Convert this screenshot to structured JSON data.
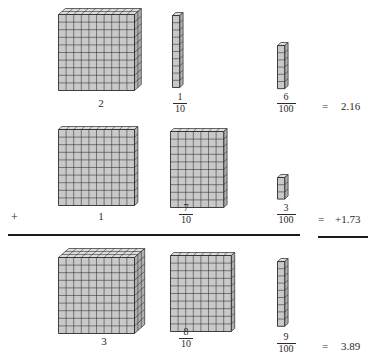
{
  "figure": {
    "operation": "addition",
    "colors": {
      "cube_face": "#c9c9c9",
      "cube_top": "#dcdcdc",
      "cube_side": "#b0b0b0",
      "stroke": "#2b2b2b",
      "text": "#2a2a2a",
      "rule": "#1a1a1a",
      "background": "#ffffff"
    }
  },
  "rows": [
    {
      "id": "addend-1",
      "operator": "",
      "equals_sign": "=",
      "result": "2.16",
      "terms": [
        {
          "place": "ones",
          "label_type": "whole",
          "whole": "2",
          "numerator": "",
          "denominator": "",
          "block": {
            "kind": "flat-stack",
            "cols": 10,
            "rows": 10,
            "depth": 2,
            "count": 200,
            "value": 2
          }
        },
        {
          "place": "tenths",
          "label_type": "fraction",
          "whole": "",
          "numerator": "1",
          "denominator": "10",
          "block": {
            "kind": "rod",
            "cols": 1,
            "rows": 10,
            "depth": 1,
            "count": 10,
            "value": 0.1
          }
        },
        {
          "place": "hundredths",
          "label_type": "fraction",
          "whole": "",
          "numerator": "6",
          "denominator": "100",
          "block": {
            "kind": "unit-stack",
            "cols": 1,
            "rows": 6,
            "depth": 1,
            "count": 6,
            "value": 0.06
          }
        }
      ]
    },
    {
      "id": "addend-2",
      "operator": "+",
      "equals_sign": "=",
      "result": "+1.73",
      "terms": [
        {
          "place": "ones",
          "label_type": "whole",
          "whole": "1",
          "numerator": "",
          "denominator": "",
          "block": {
            "kind": "flat-stack",
            "cols": 10,
            "rows": 10,
            "depth": 1,
            "count": 100,
            "value": 1
          }
        },
        {
          "place": "tenths",
          "label_type": "fraction",
          "whole": "",
          "numerator": "7",
          "denominator": "10",
          "block": {
            "kind": "rod-group",
            "cols": 7,
            "rows": 10,
            "depth": 1,
            "count": 70,
            "value": 0.7
          }
        },
        {
          "place": "hundredths",
          "label_type": "fraction",
          "whole": "",
          "numerator": "3",
          "denominator": "100",
          "block": {
            "kind": "unit-stack",
            "cols": 1,
            "rows": 3,
            "depth": 1,
            "count": 3,
            "value": 0.03
          }
        }
      ]
    },
    {
      "id": "sum",
      "operator": "",
      "equals_sign": "=",
      "result": "3.89",
      "terms": [
        {
          "place": "ones",
          "label_type": "whole",
          "whole": "3",
          "numerator": "",
          "denominator": "",
          "block": {
            "kind": "flat-stack",
            "cols": 10,
            "rows": 10,
            "depth": 3,
            "count": 300,
            "value": 3
          }
        },
        {
          "place": "tenths",
          "label_type": "fraction",
          "whole": "",
          "numerator": "8",
          "denominator": "10",
          "block": {
            "kind": "rod-group",
            "cols": 8,
            "rows": 10,
            "depth": 1,
            "count": 80,
            "value": 0.8
          }
        },
        {
          "place": "hundredths",
          "label_type": "fraction",
          "whole": "",
          "numerator": "9",
          "denominator": "100",
          "block": {
            "kind": "unit-stack",
            "cols": 1,
            "rows": 9,
            "depth": 1,
            "count": 9,
            "value": 0.09
          }
        }
      ]
    }
  ],
  "rules": [
    {
      "name": "main-sum-rule",
      "x": 8,
      "y": 234,
      "width": 292
    },
    {
      "name": "result-sum-rule",
      "x": 318,
      "y": 236,
      "width": 50
    }
  ],
  "equation": {
    "addend_1": "2.16",
    "addend_2": "1.73",
    "sum": "3.89",
    "plus": "+",
    "equals": "="
  }
}
